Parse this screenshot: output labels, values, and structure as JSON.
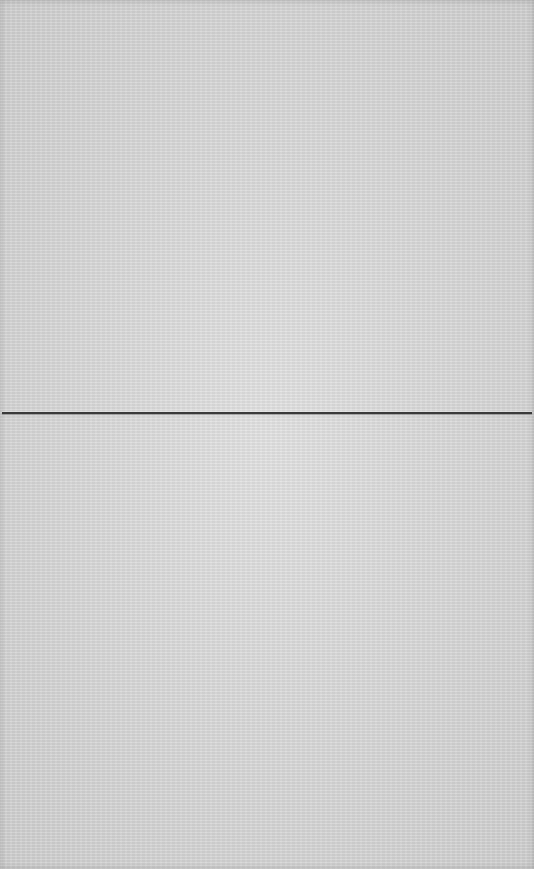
{
  "scene": {
    "subject": "blank-textured-paper",
    "paper_color": "#dcdcdc",
    "fold_line": {
      "orientation": "horizontal",
      "y": 413,
      "color": "#3a3a3a"
    }
  }
}
